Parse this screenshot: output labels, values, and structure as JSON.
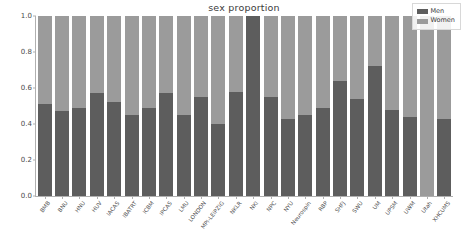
{
  "chart_data": {
    "type": "bar",
    "subtype": "stacked-bar-proportion",
    "title": "sex proportion",
    "xlabel": "",
    "ylabel": "",
    "ylim": [
      0.0,
      1.0
    ],
    "xlim_note": "categorical, 24 sites",
    "grid": false,
    "legend_position": "upper right",
    "yticks": [
      "0.0",
      "0.2",
      "0.4",
      "0.6",
      "0.8",
      "1.0"
    ],
    "ytick_values": [
      0.0,
      0.2,
      0.4,
      0.6,
      0.8,
      1.0
    ],
    "categories": [
      "BMB",
      "BNU",
      "HNU",
      "HUV",
      "IACAS",
      "IBATRT",
      "ICBM",
      "IPCAS",
      "LMU",
      "LONDON",
      "MPI-LEIPZIG",
      "NKLR",
      "NKI",
      "NPC",
      "NYU",
      "Neurospin",
      "RBP",
      "SHFJ",
      "SWU",
      "UM",
      "UPSM",
      "UWM",
      "Utah",
      "XHCUMS"
    ],
    "series": [
      {
        "name": "Men",
        "color": "#5d5d5d",
        "values": [
          0.51,
          0.47,
          0.49,
          0.57,
          0.52,
          0.45,
          0.49,
          0.57,
          0.45,
          0.55,
          0.4,
          0.58,
          1.0,
          0.55,
          0.43,
          0.45,
          0.49,
          0.64,
          0.54,
          0.72,
          0.48,
          0.44,
          0.0,
          0.43
        ]
      },
      {
        "name": "Women",
        "color": "#9b9b9b",
        "values": [
          0.49,
          0.53,
          0.51,
          0.43,
          0.48,
          0.55,
          0.51,
          0.43,
          0.55,
          0.45,
          0.6,
          0.42,
          0.0,
          0.45,
          0.57,
          0.55,
          0.51,
          0.36,
          0.46,
          0.28,
          0.52,
          0.56,
          1.0,
          0.57
        ]
      }
    ]
  },
  "legend": {
    "items": [
      {
        "label": "Men",
        "color": "#5d5d5d"
      },
      {
        "label": "Women",
        "color": "#9b9b9b"
      }
    ]
  },
  "colors": {
    "men": "#5d5d5d",
    "women": "#9b9b9b",
    "axis": "#b0b0b0",
    "text": "#4a4a4a",
    "background": "#ffffff"
  }
}
